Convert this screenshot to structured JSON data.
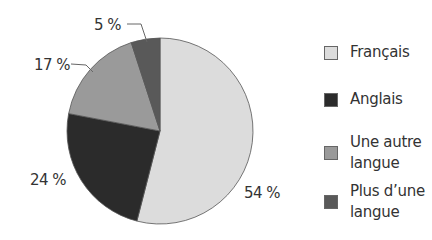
{
  "chart_data": {
    "type": "pie",
    "title": "",
    "start_angle_deg": 0,
    "direction": "clockwise",
    "slices": [
      {
        "label": "Français",
        "value": 54,
        "display": "54 %",
        "color": "#dcdcdc"
      },
      {
        "label": "Anglais",
        "value": 24,
        "display": "24 %",
        "color": "#2b2b2b"
      },
      {
        "label": "Une autre langue",
        "value": 17,
        "display": "17 %",
        "color": "#9a9a9a"
      },
      {
        "label": "Plus d’une langue",
        "value": 5,
        "display": "5 %",
        "color": "#595959"
      }
    ],
    "legend": {
      "position": "right",
      "entries": [
        {
          "lines": [
            "Français"
          ],
          "color": "#dcdcdc"
        },
        {
          "lines": [
            "Anglais"
          ],
          "color": "#2b2b2b"
        },
        {
          "lines": [
            "Une autre",
            "langue"
          ],
          "color": "#9a9a9a"
        },
        {
          "lines": [
            "Plus d’une",
            "langue"
          ],
          "color": "#595959"
        }
      ]
    }
  },
  "labels": {
    "francais_pct": "54 %",
    "anglais_pct": "24 %",
    "autre_pct": "17 %",
    "plus_pct": "5 %"
  },
  "legend": {
    "francais": "Français",
    "anglais": "Anglais",
    "autre_line1": "Une autre",
    "autre_line2": "langue",
    "plus_line1": "Plus d’une",
    "plus_line2": "langue"
  },
  "colors": {
    "francais": "#dcdcdc",
    "anglais": "#2b2b2b",
    "autre": "#9a9a9a",
    "plus": "#595959",
    "outline": "#555555"
  }
}
